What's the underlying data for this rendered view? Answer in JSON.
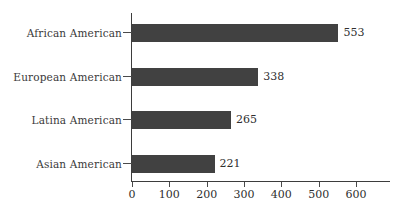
{
  "chart_data": {
    "type": "bar",
    "orientation": "horizontal",
    "title": "",
    "subtitle": "",
    "xlabel": "",
    "ylabel": "",
    "categories": [
      "African American",
      "European American",
      "Latina American",
      "Asian American"
    ],
    "values": [
      553,
      338,
      265,
      221
    ],
    "value_labels": [
      "553",
      "338",
      "265",
      "221"
    ],
    "xlim": [
      0,
      600
    ],
    "xticks": [
      0,
      100,
      200,
      300,
      400,
      500,
      600
    ],
    "xtick_labels": [
      "0",
      "100",
      "200",
      "300",
      "400",
      "500",
      "600"
    ],
    "grid": false,
    "legend": null,
    "colors": {
      "bar_fill": "#414141",
      "axis": "#3d3d3d",
      "text": "#2f2f2f",
      "background": "#ffffff"
    }
  }
}
